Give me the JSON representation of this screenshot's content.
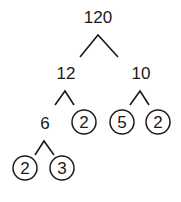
{
  "diagram": {
    "root": "120",
    "level1": {
      "left": "12",
      "right": "10"
    },
    "level2": {
      "a": "6",
      "b": "2",
      "c": "5",
      "d": "2"
    },
    "level3": {
      "a": "2",
      "b": "3"
    },
    "prime_factors_circled": [
      "2",
      "5",
      "2",
      "2",
      "3"
    ]
  }
}
